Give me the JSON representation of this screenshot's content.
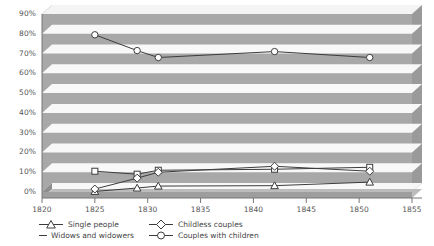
{
  "chart_data": {
    "type": "line",
    "title": "",
    "xlabel": "",
    "ylabel": "",
    "xlim": [
      1820,
      1855
    ],
    "ylim": [
      0,
      90
    ],
    "grid": true,
    "legend_position": "bottom",
    "xticks": [
      "1820",
      "1825",
      "1830",
      "1835",
      "1840",
      "1845",
      "1850",
      "1855"
    ],
    "yticks": [
      "0%",
      "10%",
      "20%",
      "30%",
      "40%",
      "50%",
      "60%",
      "70%",
      "80%",
      "90%"
    ],
    "x": [
      1825,
      1829,
      1831,
      1842,
      1851
    ],
    "series": [
      {
        "name": "Single people",
        "marker": "triangle",
        "values": [
          0.3,
          2.0,
          3.0,
          3.2,
          5.0
        ]
      },
      {
        "name": "Widows and widowers",
        "marker": "square",
        "values": [
          10.5,
          9.0,
          11.0,
          11.5,
          12.5
        ]
      },
      {
        "name": "Childless couples",
        "marker": "diamond",
        "values": [
          1.5,
          7.0,
          10.0,
          13.0,
          10.5
        ]
      },
      {
        "name": "Couples with children",
        "marker": "circle",
        "values": [
          79.5,
          71.5,
          68.0,
          71.0,
          68.0
        ]
      }
    ]
  },
  "colors": {
    "plot_background": "#a8a8a8",
    "plot_background_light": "#b4b4b4",
    "gridline": "#ffffff",
    "line": "#3c3c3c",
    "marker_fill": "#ffffff",
    "top_edge": "#6e6e6e",
    "floor_edge": "#8e8e8e",
    "text": "#4a4a4a"
  }
}
